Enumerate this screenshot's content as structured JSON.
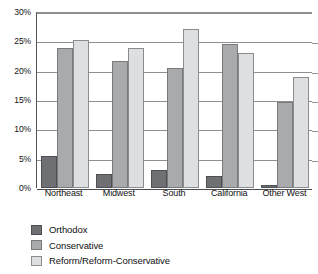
{
  "chart_data": {
    "type": "bar",
    "title": "",
    "subtitle": "",
    "xlabel": "",
    "ylabel": "",
    "categories": [
      "Northeast",
      "Midwest",
      "South",
      "California",
      "Other West"
    ],
    "series": [
      {
        "name": "Orthodox",
        "color": "#6f7073",
        "values": [
          5.5,
          2.4,
          3.1,
          2.0,
          0.5
        ]
      },
      {
        "name": "Conservative",
        "color": "#a9aaac",
        "values": [
          23.8,
          21.7,
          20.5,
          24.5,
          14.7
        ]
      },
      {
        "name": "Reform/Reform-Conservative",
        "color": "#dedfe0",
        "values": [
          25.3,
          23.8,
          27.1,
          23.0,
          19.0
        ]
      }
    ],
    "ylim": [
      0,
      30
    ],
    "ytick_values": [
      0,
      5,
      10,
      15,
      20,
      25,
      30
    ],
    "ytick_labels": [
      "0%",
      "5%",
      "10%",
      "15%",
      "20%",
      "25%",
      "30%"
    ],
    "grid": true,
    "grid_axis": "y",
    "legend_position": "bottom-left",
    "legend_entries": [
      "Orthodox",
      "Conservative",
      "Reform/Reform-Conservative"
    ]
  }
}
